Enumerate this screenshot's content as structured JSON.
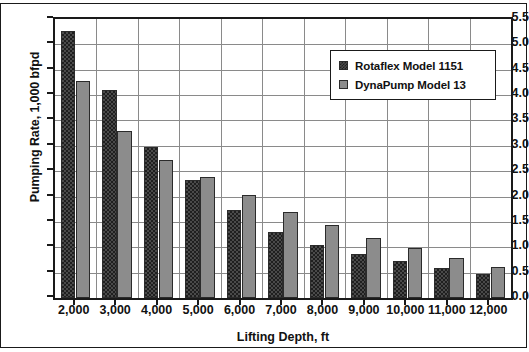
{
  "chart_data": {
    "type": "bar",
    "title": "",
    "xlabel": "Lifting Depth, ft",
    "ylabel": "Pumping Rate, 1,000 bfpd",
    "categories": [
      "2,000",
      "3,000",
      "4,000",
      "5,000",
      "6,000",
      "7,000",
      "8,000",
      "9,000",
      "10,000",
      "11,000",
      "12,000"
    ],
    "series": [
      {
        "name": "Rotaflex Model 1151",
        "values": [
          5.27,
          4.1,
          2.98,
          2.33,
          1.74,
          1.3,
          1.05,
          0.86,
          0.73,
          0.6,
          0.47
        ],
        "color": "#4a4a4a",
        "pattern": "checkered"
      },
      {
        "name": "DynaPump Model 13",
        "values": [
          4.28,
          3.3,
          2.72,
          2.38,
          2.04,
          1.69,
          1.44,
          1.19,
          0.98,
          0.78,
          0.62
        ],
        "color": "#8c8c8c",
        "pattern": "solid"
      }
    ],
    "ylim": [
      0.0,
      5.5
    ],
    "ytick_labels": [
      "0.0",
      "0.5",
      "1.0",
      "1.5",
      "2.0",
      "2.5",
      "3.0",
      "3.5",
      "4.0",
      "4.5",
      "5.0",
      "5.5"
    ],
    "ytick_values": [
      0.0,
      0.5,
      1.0,
      1.5,
      2.0,
      2.5,
      3.0,
      3.5,
      4.0,
      4.5,
      5.0,
      5.5
    ],
    "grid": true,
    "grid_axis": "both",
    "legend_position": "upper-right",
    "legend_entries": [
      "Rotaflex Model 1151",
      "DynaPump Model 13"
    ]
  }
}
